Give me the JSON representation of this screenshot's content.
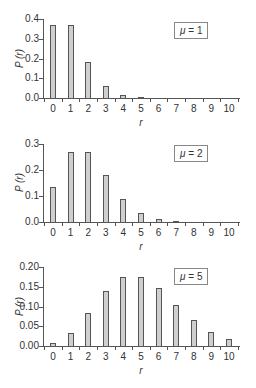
{
  "chart_data": [
    {
      "type": "bar",
      "title": "",
      "legend": "μ = 1",
      "xlabel": "r",
      "ylabel": "P (r)",
      "categories": [
        0,
        1,
        2,
        3,
        4,
        5,
        6,
        7,
        8,
        9,
        10
      ],
      "values": [
        0.368,
        0.368,
        0.184,
        0.061,
        0.015,
        0.003,
        0.0005,
        0.0001,
        0,
        0,
        0
      ],
      "ylim": [
        0,
        0.4
      ],
      "yticks": [
        "0.0",
        "0.1",
        "0.2",
        "0.3",
        "0.4"
      ],
      "legend_position": "upper right",
      "grid": false
    },
    {
      "type": "bar",
      "title": "",
      "legend": "μ = 2",
      "xlabel": "r",
      "ylabel": "P (r)",
      "categories": [
        0,
        1,
        2,
        3,
        4,
        5,
        6,
        7,
        8,
        9,
        10
      ],
      "values": [
        0.135,
        0.271,
        0.271,
        0.18,
        0.09,
        0.036,
        0.012,
        0.003,
        0.001,
        0.0002,
        0
      ],
      "ylim": [
        0,
        0.3
      ],
      "yticks": [
        "0.0",
        "0.1",
        "0.2",
        "0.3"
      ],
      "legend_position": "upper right",
      "grid": false
    },
    {
      "type": "bar",
      "title": "",
      "legend": "μ = 5",
      "xlabel": "r",
      "ylabel": "P (r)",
      "categories": [
        0,
        1,
        2,
        3,
        4,
        5,
        6,
        7,
        8,
        9,
        10
      ],
      "values": [
        0.007,
        0.034,
        0.084,
        0.14,
        0.175,
        0.175,
        0.146,
        0.104,
        0.065,
        0.036,
        0.018
      ],
      "ylim": [
        0,
        0.2
      ],
      "yticks": [
        "0.00",
        "0.05",
        "0.10",
        "0.15",
        "0.20"
      ],
      "legend_position": "upper right",
      "grid": false
    }
  ],
  "panels": [
    {
      "legend_mu": "μ",
      "legend_eq": " = 1",
      "ylabel": "P (r)",
      "xlabel": "r"
    },
    {
      "legend_mu": "μ",
      "legend_eq": " = 2",
      "ylabel": "P (r)",
      "xlabel": "r"
    },
    {
      "legend_mu": "μ",
      "legend_eq": " = 5",
      "ylabel": "P (r)",
      "xlabel": "r"
    }
  ]
}
